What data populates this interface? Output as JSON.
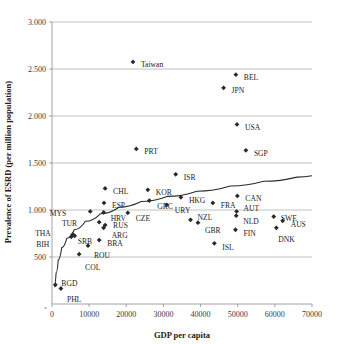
{
  "chart_data": {
    "type": "scatter",
    "title": "",
    "xlabel": "GDP per capita",
    "ylabel": "Prevalence of ESRD (per million population)",
    "xlim": [
      0,
      70000
    ],
    "ylim": [
      0,
      3000
    ],
    "xticks": [
      "0",
      "10000",
      "20000",
      "30000",
      "40000",
      "50000",
      "60000",
      "70000"
    ],
    "xtick_values": [
      0,
      10000,
      20000,
      30000,
      40000,
      50000,
      60000,
      70000
    ],
    "yticks": [
      "500",
      "1.000",
      "1.500",
      "2.000",
      "2.500",
      "3.000"
    ],
    "ytick_values": [
      500,
      1000,
      1500,
      2000,
      2500,
      3000
    ],
    "grid": "horizontal",
    "legend": "none",
    "marker": "diamond",
    "series_name": "Countries",
    "points": [
      {
        "label": "Taiwan",
        "x": 21800,
        "y": 2575,
        "lx": 8,
        "ly": 3
      },
      {
        "label": "BEL",
        "x": 49500,
        "y": 2440,
        "lx": 8,
        "ly": 3
      },
      {
        "label": "JPN",
        "x": 46200,
        "y": 2300,
        "lx": 8,
        "ly": 3
      },
      {
        "label": "USA",
        "x": 49800,
        "y": 1910,
        "lx": 8,
        "ly": 3
      },
      {
        "label": "PRT",
        "x": 22700,
        "y": 1650,
        "lx": 8,
        "ly": 3
      },
      {
        "label": "SGP",
        "x": 52200,
        "y": 1635,
        "lx": 8,
        "ly": 3
      },
      {
        "label": "ISR",
        "x": 33300,
        "y": 1380,
        "lx": 8,
        "ly": 3
      },
      {
        "label": "CHL",
        "x": 14300,
        "y": 1230,
        "lx": 8,
        "ly": 3
      },
      {
        "label": "KOR",
        "x": 25800,
        "y": 1215,
        "lx": 8,
        "ly": 3
      },
      {
        "label": "CAN",
        "x": 49900,
        "y": 1150,
        "lx": 8,
        "ly": 3
      },
      {
        "label": "HKG",
        "x": 34700,
        "y": 1135,
        "lx": 8,
        "ly": 3
      },
      {
        "label": "ESP",
        "x": 14000,
        "y": 1075,
        "lx": 8,
        "ly": 3
      },
      {
        "label": "GRC",
        "x": 26200,
        "y": 1100,
        "lx": 8,
        "ly": 6
      },
      {
        "label": "FRA",
        "x": 43300,
        "y": 1075,
        "lx": 8,
        "ly": 3
      },
      {
        "label": "URY",
        "x": 30900,
        "y": 1055,
        "lx": 8,
        "ly": 6
      },
      {
        "label": "MYS",
        "x": 10300,
        "y": 985,
        "lx": -24,
        "ly": 2
      },
      {
        "label": "HRV",
        "x": 13900,
        "y": 975,
        "lx": 7,
        "ly": 6
      },
      {
        "label": "CZE",
        "x": 20400,
        "y": 970,
        "lx": 8,
        "ly": 6
      },
      {
        "label": "AUT",
        "x": 49700,
        "y": 985,
        "lx": 7,
        "ly": -3
      },
      {
        "label": "NLD",
        "x": 49600,
        "y": 940,
        "lx": 7,
        "ly": 6
      },
      {
        "label": "SWE",
        "x": 59700,
        "y": 930,
        "lx": 7,
        "ly": 2
      },
      {
        "label": "NZL",
        "x": 37300,
        "y": 895,
        "lx": 7,
        "ly": -2
      },
      {
        "label": "AUS",
        "x": 62100,
        "y": 885,
        "lx": 8,
        "ly": 4
      },
      {
        "label": "TUR",
        "x": 12700,
        "y": 870,
        "lx": -22,
        "ly": 1
      },
      {
        "label": "GBR",
        "x": 39300,
        "y": 865,
        "lx": 7,
        "ly": 8
      },
      {
        "label": "RUS",
        "x": 14300,
        "y": 840,
        "lx": 8,
        "ly": 1
      },
      {
        "label": "ARG",
        "x": 13900,
        "y": 810,
        "lx": 8,
        "ly": 8
      },
      {
        "label": "FIN",
        "x": 49400,
        "y": 790,
        "lx": 8,
        "ly": 4
      },
      {
        "label": "DNK",
        "x": 60400,
        "y": 810,
        "lx": 2,
        "ly": 12
      },
      {
        "label": "THA",
        "x": 5600,
        "y": 740,
        "lx": -22,
        "ly": -1
      },
      {
        "label": "SRB",
        "x": 6100,
        "y": 725,
        "lx": 3,
        "ly": 6
      },
      {
        "label": "BIH",
        "x": 5200,
        "y": 715,
        "lx": -22,
        "ly": 8
      },
      {
        "label": "BRA",
        "x": 12700,
        "y": 680,
        "lx": 8,
        "ly": 4
      },
      {
        "label": "ISL",
        "x": 43700,
        "y": 645,
        "lx": 8,
        "ly": 4
      },
      {
        "label": "ROU",
        "x": 9700,
        "y": 620,
        "lx": 6,
        "ly": 10
      },
      {
        "label": "COL",
        "x": 7300,
        "y": 530,
        "lx": 6,
        "ly": 13
      },
      {
        "label": "BGD",
        "x": 900,
        "y": 205,
        "lx": 6,
        "ly": -1
      },
      {
        "label": "PHL",
        "x": 2400,
        "y": 165,
        "lx": 6,
        "ly": 11
      }
    ],
    "trendline": {
      "description": "logarithmic fit curve",
      "points": [
        {
          "x": 600,
          "y": 180
        },
        {
          "x": 1100,
          "y": 330
        },
        {
          "x": 1700,
          "y": 470
        },
        {
          "x": 2600,
          "y": 600
        },
        {
          "x": 4000,
          "y": 700
        },
        {
          "x": 6000,
          "y": 790
        },
        {
          "x": 9000,
          "y": 880
        },
        {
          "x": 13000,
          "y": 960
        },
        {
          "x": 18000,
          "y": 1030
        },
        {
          "x": 24000,
          "y": 1090
        },
        {
          "x": 31000,
          "y": 1145
        },
        {
          "x": 39000,
          "y": 1200
        },
        {
          "x": 48000,
          "y": 1255
        },
        {
          "x": 57000,
          "y": 1305
        },
        {
          "x": 66000,
          "y": 1350
        },
        {
          "x": 70000,
          "y": 1365
        }
      ]
    }
  }
}
